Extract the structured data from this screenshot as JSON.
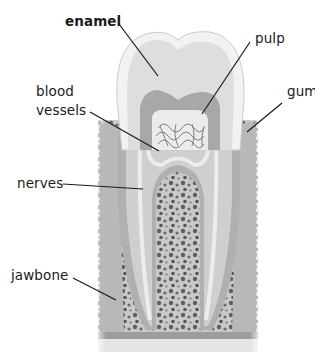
{
  "diagram": {
    "labels": {
      "enamel": "enamel",
      "pulp": "pulp",
      "blood_line1": "blood",
      "blood_line2": "vessels",
      "gum": "gum",
      "nerves": "nerves",
      "jawbone": "jawbone"
    },
    "colors": {
      "enamel": "#f0f0f0",
      "dentin": "#d4d4d4",
      "dentin_dark": "#a9a9a9",
      "pulp": "#e6e6e6",
      "gum": "#b8b8b8",
      "bone": "#c9c9c9",
      "bone_pores": "#5a5a5a",
      "leader": "#1a1a1a",
      "text": "#1a1a1a"
    }
  }
}
